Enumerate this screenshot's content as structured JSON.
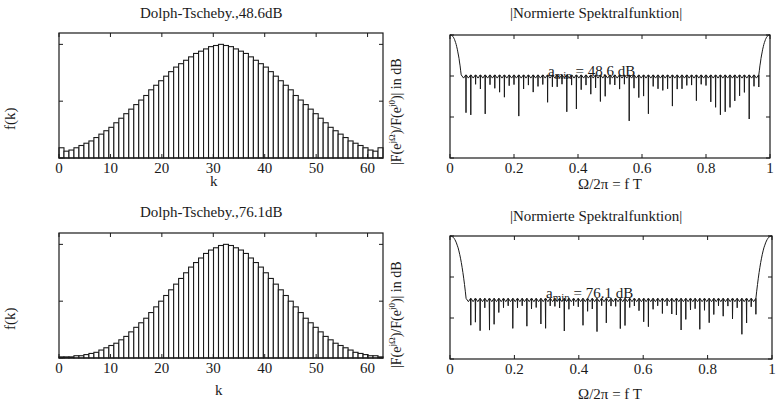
{
  "chart_data": [
    {
      "type": "bar",
      "title": "Dolph-Tscheby.,48.6dB",
      "xlabel": "k",
      "ylabel": "f(k)",
      "xlim": [
        0,
        63
      ],
      "ylim": [
        0,
        1.1
      ],
      "xticks": [
        "0",
        "10",
        "20",
        "30",
        "40",
        "50",
        "60"
      ],
      "yticks": [
        "0",
        "0.5",
        "1"
      ],
      "grid": false,
      "n_coefficients": 63,
      "values": [
        0.09,
        0.06,
        0.07,
        0.09,
        0.11,
        0.13,
        0.15,
        0.18,
        0.21,
        0.24,
        0.27,
        0.31,
        0.35,
        0.39,
        0.43,
        0.47,
        0.51,
        0.55,
        0.6,
        0.64,
        0.68,
        0.72,
        0.76,
        0.8,
        0.83,
        0.86,
        0.89,
        0.92,
        0.94,
        0.96,
        0.98,
        0.99,
        1.0,
        0.99,
        0.98,
        0.96,
        0.94,
        0.92,
        0.89,
        0.86,
        0.83,
        0.8,
        0.76,
        0.72,
        0.68,
        0.64,
        0.6,
        0.55,
        0.51,
        0.47,
        0.43,
        0.39,
        0.35,
        0.31,
        0.27,
        0.24,
        0.21,
        0.18,
        0.15,
        0.13,
        0.11,
        0.09,
        0.07,
        0.06,
        0.09
      ]
    },
    {
      "type": "line",
      "title": "|Normierte Spektralfunktion|",
      "xlabel": "Ω/2π = f T",
      "ylabel": "|F(e^{jΩ})/F(e^{j0})| in dB",
      "xlim": [
        0,
        1
      ],
      "ylim": [
        -150,
        0
      ],
      "xticks": [
        "0",
        "0.2",
        "0.4",
        "0.6",
        "0.8",
        "1"
      ],
      "yticks": [
        "0",
        "-50",
        "-100",
        "-150"
      ],
      "grid": false,
      "annotation": "a_min = 48.6 dB",
      "mainlobe_edge": 0.035,
      "sidelobe_level_db": -48.6,
      "null_depth_range_db": [
        -60,
        -105
      ]
    },
    {
      "type": "bar",
      "title": "Dolph-Tscheby.,76.1dB",
      "xlabel": "k",
      "ylabel": "f(k)",
      "xlim": [
        0,
        63
      ],
      "ylim": [
        0,
        1.1
      ],
      "xticks": [
        "0",
        "10",
        "20",
        "30",
        "40",
        "50",
        "60"
      ],
      "yticks": [
        "0",
        "0.5",
        "1"
      ],
      "grid": false,
      "n_coefficients": 63,
      "values": [
        0.01,
        0.01,
        0.01,
        0.02,
        0.02,
        0.03,
        0.04,
        0.05,
        0.07,
        0.09,
        0.11,
        0.13,
        0.16,
        0.19,
        0.23,
        0.27,
        0.31,
        0.35,
        0.4,
        0.45,
        0.5,
        0.55,
        0.6,
        0.65,
        0.7,
        0.75,
        0.8,
        0.84,
        0.88,
        0.92,
        0.95,
        0.97,
        0.99,
        1.0,
        0.99,
        0.97,
        0.95,
        0.92,
        0.88,
        0.84,
        0.8,
        0.75,
        0.7,
        0.65,
        0.6,
        0.55,
        0.5,
        0.45,
        0.4,
        0.35,
        0.31,
        0.27,
        0.23,
        0.19,
        0.16,
        0.13,
        0.11,
        0.09,
        0.07,
        0.05,
        0.04,
        0.03,
        0.02,
        0.02,
        0.01
      ]
    },
    {
      "type": "line",
      "title": "|Normierte Spektralfunktion|",
      "xlabel": "Ω/2π = f T",
      "ylabel": "|F(e^{jΩ})/F(e^{j0})| in dB",
      "xlim": [
        0,
        1
      ],
      "ylim": [
        -150,
        0
      ],
      "xticks": [
        "0",
        "0.2",
        "0.4",
        "0.6",
        "0.8",
        "1"
      ],
      "yticks": [
        "0",
        "-50",
        "-100",
        "-150"
      ],
      "grid": false,
      "annotation": "a_min = 76.1 dB",
      "mainlobe_edge": 0.05,
      "sidelobe_level_db": -76.1,
      "null_depth_range_db": [
        -85,
        -120
      ]
    }
  ],
  "panels": {
    "tl": {
      "title": "Dolph-Tscheby.,48.6dB",
      "xlabel": "k",
      "ylabel": "f(k)"
    },
    "tr": {
      "title": "|Normierte Spektralfunktion|",
      "xlabel": "Ω/2π = f T",
      "ylabel_main": "|F(e",
      "ylabel_sup1": "jΩ",
      "ylabel_mid": ")/F(e",
      "ylabel_sup2": "j0",
      "ylabel_end": ")| in dB",
      "annot_a": "a",
      "annot_sub": "min",
      "annot_val": " = 48.6 dB"
    },
    "bl": {
      "title": "Dolph-Tscheby.,76.1dB",
      "xlabel": "k",
      "ylabel": "f(k)"
    },
    "br": {
      "title": "|Normierte Spektralfunktion|",
      "xlabel": "Ω/2π = f T",
      "ylabel_main": "|F(e",
      "ylabel_sup1": "jΩ",
      "ylabel_mid": ")/F(e",
      "ylabel_sup2": "j0",
      "ylabel_end": ")| in dB",
      "annot_a": "a",
      "annot_sub": "min",
      "annot_val": " = 76.1 dB"
    }
  },
  "colors": {
    "ink": "#1a1a1a",
    "background": "#ffffff"
  }
}
